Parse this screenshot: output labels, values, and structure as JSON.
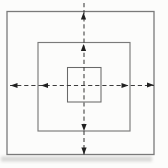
{
  "canvas": {
    "width": 168,
    "height": 168,
    "background": "#fcfcfb"
  },
  "diagram": {
    "colors": {
      "square_stroke": "#7a7a7a",
      "inner_square_stroke": "#696969",
      "dash_stroke": "#3c3c3c",
      "arrow_fill": "#202020",
      "scan_shadow": "#b4b4b2"
    },
    "squares": [
      {
        "name": "outer-square",
        "x": 7,
        "y": 11.5,
        "width": 147,
        "height": 143,
        "stroke_width": 1.3
      },
      {
        "name": "middle-square",
        "x": 38,
        "y": 42.5,
        "width": 92,
        "height": 88.5,
        "stroke_width": 1.15
      },
      {
        "name": "inner-square",
        "x": 67.5,
        "y": 67.5,
        "width": 33.5,
        "height": 34.5,
        "stroke_width": 1.05
      }
    ],
    "axes": {
      "dash_pattern": "4.2 2.9",
      "stroke_width": 1.05,
      "horizontal": {
        "name": "horizontal-dashed-axis",
        "y": 85.5,
        "x1": 10,
        "x2": 154
      },
      "vertical": {
        "name": "vertical-dashed-axis",
        "x": 84,
        "y1": 3,
        "y2": 154.5
      }
    },
    "arrow_size": {
      "length": 7,
      "half_width": 2.6
    },
    "arrowheads": [
      {
        "name": "arrowhead-up-outer",
        "direction": "up",
        "tip_x": 83.5,
        "tip_y": 12.5
      },
      {
        "name": "arrowhead-up-middle",
        "direction": "up",
        "tip_x": 83.5,
        "tip_y": 44
      },
      {
        "name": "arrowhead-down-middle",
        "direction": "down",
        "tip_x": 84,
        "tip_y": 131
      },
      {
        "name": "arrowhead-down-outer",
        "direction": "down",
        "tip_x": 84,
        "tip_y": 154.5
      },
      {
        "name": "arrowhead-left-outer",
        "direction": "left",
        "tip_x": 10.5,
        "tip_y": 85.5
      },
      {
        "name": "arrowhead-left-middle",
        "direction": "left",
        "tip_x": 41,
        "tip_y": 85.5
      },
      {
        "name": "arrowhead-right-middle",
        "direction": "right",
        "tip_x": 128.5,
        "tip_y": 85.5
      },
      {
        "name": "arrowhead-right-outer",
        "direction": "right",
        "tip_x": 154,
        "tip_y": 85
      }
    ],
    "scan_shadow": {
      "name": "scan-shadow-bottom",
      "x": 1,
      "y": 156.5,
      "width": 151,
      "height": 5,
      "opacity": 0.5
    }
  }
}
